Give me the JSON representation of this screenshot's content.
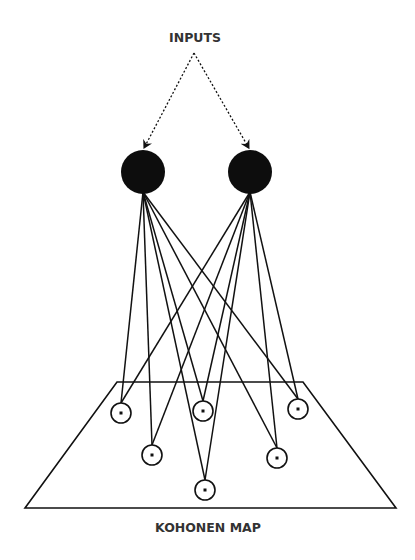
{
  "diagram": {
    "inputs_label": "INPUTS",
    "map_label": "KOHONEN MAP",
    "colors": {
      "stroke": "#111111",
      "node_fill": "#0d0d0d",
      "text": "#333333",
      "background": "#ffffff"
    },
    "input_source": {
      "x": 194,
      "y": 53
    },
    "input_nodes": [
      {
        "id": "input-1",
        "cx": 143,
        "cy": 172,
        "r": 22
      },
      {
        "id": "input-2",
        "cx": 250,
        "cy": 172,
        "r": 22
      }
    ],
    "map_plane": {
      "top_left": [
        117,
        382
      ],
      "top_right": [
        303,
        382
      ],
      "bottom_right": [
        396,
        508
      ],
      "bottom_left": [
        25,
        508
      ]
    },
    "map_nodes": [
      {
        "id": "map-node-1",
        "cx": 121,
        "cy": 413,
        "r": 10
      },
      {
        "id": "map-node-2",
        "cx": 203,
        "cy": 411,
        "r": 10
      },
      {
        "id": "map-node-3",
        "cx": 298,
        "cy": 409,
        "r": 10
      },
      {
        "id": "map-node-4",
        "cx": 152,
        "cy": 455,
        "r": 10
      },
      {
        "id": "map-node-5",
        "cx": 277,
        "cy": 458,
        "r": 10
      },
      {
        "id": "map-node-6",
        "cx": 205,
        "cy": 490,
        "r": 10
      }
    ],
    "connections": "each input node connects to every map node (fully connected)"
  }
}
